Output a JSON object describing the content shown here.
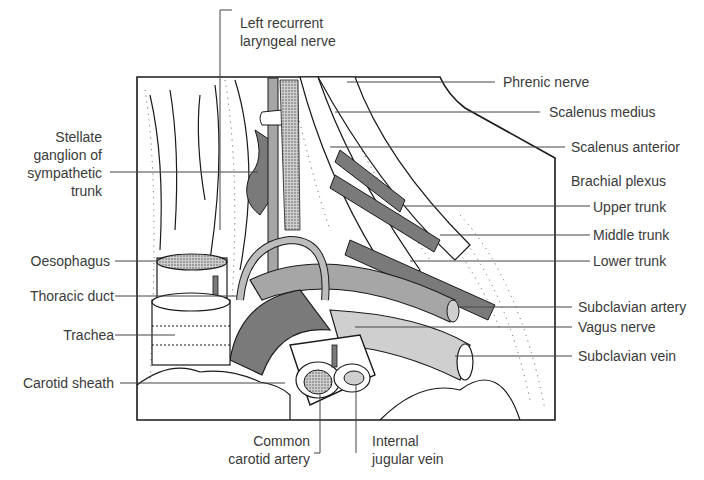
{
  "diagram": {
    "labels": {
      "left_recurrent_laryngeal_nerve": [
        "Left recurrent",
        "laryngeal nerve"
      ],
      "phrenic_nerve": "Phrenic nerve",
      "scalenus_medius": "Scalenus medius",
      "scalenus_anterior": "Scalenus anterior",
      "brachial_plexus": "Brachial plexus",
      "upper_trunk": "Upper trunk",
      "middle_trunk": "Middle trunk",
      "lower_trunk": "Lower trunk",
      "stellate_ganglion": [
        "Stellate",
        "ganglion of",
        "sympathetic",
        "trunk"
      ],
      "oesophagus": "Oesophagus",
      "thoracic_duct": "Thoracic duct",
      "trachea": "Trachea",
      "carotid_sheath": "Carotid sheath",
      "subclavian_artery": "Subclavian artery",
      "vagus_nerve": "Vagus nerve",
      "subclavian_vein": "Subclavian vein",
      "common_carotid_artery": [
        "Common",
        "carotid artery"
      ],
      "internal_jugular_vein": [
        "Internal",
        "jugular vein"
      ]
    },
    "colors": {
      "outline": "#1a1a1a",
      "leader_line": "#444444",
      "text": "#3a3a3a",
      "dark_grey_structure": "#7a7a7a",
      "mid_grey_structure": "#a6a6a6",
      "light_grey_structure": "#cfcfcf",
      "background": "#ffffff"
    }
  }
}
